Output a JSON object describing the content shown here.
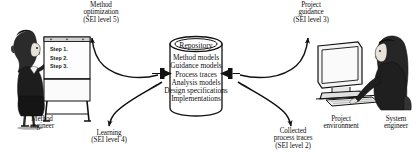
{
  "figure": {
    "type": "process-flow-diagram",
    "style": "black-and-white scanned line art with clip-art figures",
    "background_color": "#ffffff",
    "ink_color": "#111111"
  },
  "repository": {
    "title": "Repository",
    "items": [
      "Method models",
      "Guidance models",
      "Process traces",
      "Analysis models",
      "Design specifications",
      "Implementations"
    ]
  },
  "actors": {
    "left": {
      "label_line1": "Method",
      "label_line2": "engineer",
      "prop": "flipchart",
      "chart_steps": [
        "Step 1.",
        "Step 2.",
        "Step 3."
      ]
    },
    "right_environment": {
      "label_line1": "Project",
      "label_line2": "environment"
    },
    "right_engineer": {
      "label_line1": "System",
      "label_line2": "engineer"
    }
  },
  "flows": [
    {
      "id": "method-optimization",
      "lines": [
        "Method",
        "optimization",
        "(SEI level 5)"
      ],
      "direction": "repository-to-method-engineer",
      "position": "top-left"
    },
    {
      "id": "project-guidance",
      "lines": [
        "Project",
        "guidance",
        "(SEI level 3)"
      ],
      "direction": "repository-to-project-environment",
      "position": "top-right"
    },
    {
      "id": "learning",
      "lines": [
        "Learning",
        "(SEI level 4)"
      ],
      "direction": "method-engineer-to-repository",
      "position": "bottom-left"
    },
    {
      "id": "collected-process-traces",
      "lines": [
        "Collected",
        "process traces",
        "(SEI level 2)"
      ],
      "direction": "project-environment-to-repository",
      "position": "bottom-right"
    }
  ]
}
